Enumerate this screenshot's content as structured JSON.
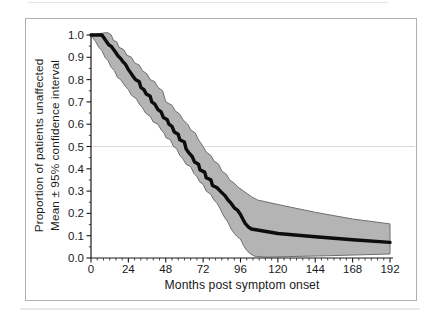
{
  "figure": {
    "y_axis_title_line1": "Proportion of patients unaffected",
    "y_axis_title_line2": "Mean ± 95% confidence interval",
    "x_axis_title": "Months post symptom onset"
  },
  "chart_data": {
    "type": "area",
    "title": "",
    "xlabel": "Months post symptom onset",
    "ylabel_line1": "Proportion of patients unaffected",
    "ylabel_line2": "Mean ± 95% confidence interval",
    "xlim": [
      0,
      192
    ],
    "ylim": [
      0.0,
      1.0
    ],
    "x_ticks": [
      "0",
      "24",
      "48",
      "72",
      "96",
      "120",
      "144",
      "168",
      "192"
    ],
    "y_ticks": [
      "0.0",
      "0.1",
      "0.2",
      "0.3",
      "0.4",
      "0.5",
      "0.6",
      "0.7",
      "0.8",
      "0.9",
      "1.0"
    ],
    "grid": "single horizontal reference line",
    "reference_line_y": 0.5,
    "legend_position": "none",
    "series": [
      {
        "name": "mean",
        "style": "thick black line",
        "x": [
          0,
          7,
          8.5,
          10,
          11.5,
          13,
          14.5,
          16,
          17.5,
          19,
          20.5,
          22,
          24,
          25.5,
          27,
          28.5,
          31,
          32,
          34,
          35.5,
          38,
          39,
          41,
          43,
          45,
          46.5,
          49,
          50,
          52,
          53.5,
          56,
          57,
          60,
          61,
          63,
          65,
          66.5,
          69,
          70,
          73,
          74,
          77,
          78,
          81,
          83,
          86,
          88,
          90,
          92,
          94,
          96,
          97.5,
          99,
          101,
          103,
          120,
          144,
          168,
          192
        ],
        "y": [
          1.0,
          1.0,
          0.985,
          0.97,
          0.955,
          0.95,
          0.935,
          0.92,
          0.905,
          0.895,
          0.88,
          0.87,
          0.845,
          0.83,
          0.815,
          0.8,
          0.79,
          0.765,
          0.755,
          0.735,
          0.725,
          0.7,
          0.69,
          0.665,
          0.655,
          0.63,
          0.62,
          0.6,
          0.59,
          0.565,
          0.555,
          0.53,
          0.52,
          0.49,
          0.47,
          0.455,
          0.43,
          0.42,
          0.395,
          0.385,
          0.36,
          0.35,
          0.325,
          0.315,
          0.3,
          0.28,
          0.26,
          0.245,
          0.225,
          0.215,
          0.195,
          0.175,
          0.155,
          0.14,
          0.13,
          0.11,
          0.095,
          0.082,
          0.07
        ]
      },
      {
        "name": "upper_95ci",
        "style": "gray band upper edge",
        "x": [
          0,
          9,
          11,
          13,
          14.5,
          16.5,
          18,
          21,
          23,
          26,
          28,
          31,
          33,
          36,
          38,
          41,
          43,
          46,
          48,
          52,
          54,
          57,
          59,
          62,
          64,
          67,
          69,
          72,
          74,
          77,
          79,
          82,
          84,
          87,
          89,
          92,
          94,
          98,
          100,
          103,
          107,
          120,
          144,
          168,
          192
        ],
        "y": [
          1.0,
          1.01,
          1.01,
          1.0,
          0.975,
          0.97,
          0.945,
          0.935,
          0.91,
          0.9,
          0.875,
          0.865,
          0.84,
          0.825,
          0.8,
          0.79,
          0.765,
          0.75,
          0.7,
          0.685,
          0.66,
          0.645,
          0.62,
          0.6,
          0.575,
          0.56,
          0.53,
          0.5,
          0.475,
          0.46,
          0.435,
          0.42,
          0.39,
          0.375,
          0.35,
          0.335,
          0.32,
          0.3,
          0.29,
          0.275,
          0.26,
          0.24,
          0.205,
          0.175,
          0.153
        ]
      },
      {
        "name": "lower_95ci",
        "style": "gray band lower edge",
        "x": [
          0,
          3,
          5,
          7,
          9,
          11,
          13,
          15,
          17,
          19,
          22,
          24,
          26,
          29,
          31,
          33,
          35,
          38,
          40,
          43,
          45,
          47,
          48,
          51,
          53,
          55,
          57,
          59,
          61,
          64,
          66,
          68,
          70,
          72,
          74,
          77,
          79,
          81,
          83,
          84,
          86,
          88,
          90,
          92,
          94,
          96,
          98,
          100,
          102,
          105,
          112,
          150,
          192
        ],
        "y": [
          1.0,
          0.97,
          0.945,
          0.93,
          0.9,
          0.885,
          0.855,
          0.84,
          0.81,
          0.8,
          0.77,
          0.755,
          0.73,
          0.715,
          0.69,
          0.675,
          0.65,
          0.635,
          0.61,
          0.6,
          0.575,
          0.56,
          0.54,
          0.53,
          0.5,
          0.49,
          0.46,
          0.445,
          0.42,
          0.41,
          0.38,
          0.365,
          0.34,
          0.33,
          0.3,
          0.285,
          0.26,
          0.245,
          0.22,
          0.205,
          0.18,
          0.16,
          0.13,
          0.11,
          0.095,
          0.085,
          0.055,
          0.035,
          0.02,
          0.008,
          0.004,
          0.01,
          0.018
        ]
      }
    ],
    "colors": {
      "band_fill": "#b4b4b4",
      "band_edge": "#6f6f6f",
      "mean_line": "#0d0d0d",
      "axis": "#1a1a1a",
      "reference_line": "#d9d9d9",
      "frame_border": "#b0b0b0",
      "page_rule": "#e4e4e4",
      "text": "#1a1a1a"
    }
  }
}
